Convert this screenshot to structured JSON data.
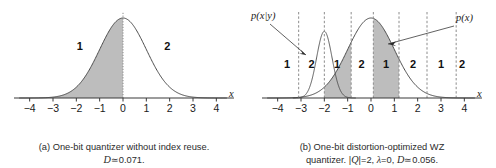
{
  "figure": {
    "background": "#ffffff",
    "curve_color": "#4a4a4a",
    "shade_color": "#bdbdbd",
    "axis_color": "#3a3a3a",
    "dash_color": "#8c8c8c"
  },
  "panel_a": {
    "caption_line1": "(a) One-bit quantizer without index reuse.",
    "caption_distortion_symbol": "D",
    "caption_line2_rest": "≃0.071.",
    "axis_label": "x",
    "ticks": [
      "−4",
      "−3",
      "−2",
      "−1",
      "0",
      "1",
      "2",
      "3",
      "4"
    ],
    "tick_values": [
      -4,
      -3,
      -2,
      -1,
      0,
      1,
      2,
      3,
      4
    ],
    "region_labels": [
      "1",
      "2"
    ],
    "boundaries": [
      0
    ],
    "shaded_intervals": [
      [
        -4.4,
        0
      ]
    ],
    "density": {
      "name": "p(x)",
      "type": "gaussian",
      "mean": 0,
      "sigma": 1.0
    }
  },
  "panel_b": {
    "caption_line1": "(b) One-bit distortion-optimized WZ",
    "caption_line2_prefix": "quantizer. |",
    "caption_q_symbol": "Q",
    "caption_line2_mid": "|=2, ",
    "caption_lambda_symbol": "λ",
    "caption_line2_mid2": "=0, ",
    "caption_distortion_symbol": "D",
    "caption_line2_rest": "≃0.056.",
    "axis_label": "x",
    "ticks": [
      "−4",
      "−3",
      "−2",
      "−1",
      "0",
      "1",
      "2",
      "3",
      "4"
    ],
    "tick_values": [
      -4,
      -3,
      -2,
      -1,
      0,
      1,
      2,
      3,
      4
    ],
    "region_labels": [
      "1",
      "2",
      "1",
      "2",
      "1",
      "2",
      "1",
      "2"
    ],
    "region_centers": [
      -3.6,
      -2.55,
      -1.45,
      -0.4,
      0.65,
      1.8,
      3.0,
      3.9
    ],
    "boundaries": [
      -3.1,
      -2.0,
      -0.85,
      0.1,
      1.2,
      2.4,
      3.65
    ],
    "shaded_intervals": [
      [
        -2.0,
        -0.85
      ],
      [
        0.1,
        1.2
      ]
    ],
    "annotation_pxy": "p(x|y)",
    "annotation_px": "p(x)",
    "densities": [
      {
        "name": "p(x)",
        "type": "gaussian",
        "mean": 0,
        "sigma": 1.0
      },
      {
        "name": "p(x|y)",
        "type": "gaussian",
        "mean": -2.0,
        "sigma": 0.33
      }
    ]
  },
  "chart_data": {
    "type": "line",
    "title": "",
    "xlabel": "x",
    "ylabel": "",
    "xlim": [
      -4.5,
      4.5
    ],
    "grid": false,
    "legend": "annotations",
    "panels": [
      {
        "id": "a",
        "caption": "(a) One-bit quantizer without index reuse. D≃0.071.",
        "distortion": 0.071,
        "xticks": [
          -4,
          -3,
          -2,
          -1,
          0,
          1,
          2,
          3,
          4
        ],
        "series": [
          {
            "name": "p(x)",
            "type": "gaussian",
            "mean": 0,
            "sigma": 1.0,
            "x": [
              -4,
              -3.5,
              -3,
              -2.5,
              -2,
              -1.5,
              -1,
              -0.5,
              0,
              0.5,
              1,
              1.5,
              2,
              2.5,
              3,
              3.5,
              4
            ],
            "values": [
              0.0001,
              0.0009,
              0.0044,
              0.0175,
              0.054,
              0.1295,
              0.242,
              0.3521,
              0.3989,
              0.3521,
              0.242,
              0.1295,
              0.054,
              0.0175,
              0.0044,
              0.0009,
              0.0001
            ]
          }
        ],
        "partition_boundaries": [
          0
        ],
        "region_labels": [
          "1",
          "2"
        ],
        "shaded_intervals": [
          [
            -4.4,
            0
          ]
        ]
      },
      {
        "id": "b",
        "caption": "(b) One-bit distortion-optimized WZ quantizer. |Q|=2, λ=0, D≃0.056.",
        "distortion": 0.056,
        "codebook_size": 2,
        "lambda": 0,
        "xticks": [
          -4,
          -3,
          -2,
          -1,
          0,
          1,
          2,
          3,
          4
        ],
        "series": [
          {
            "name": "p(x)",
            "type": "gaussian",
            "mean": 0,
            "sigma": 1.0,
            "x": [
              -4,
              -3.5,
              -3,
              -2.5,
              -2,
              -1.5,
              -1,
              -0.5,
              0,
              0.5,
              1,
              1.5,
              2,
              2.5,
              3,
              3.5,
              4
            ],
            "values": [
              0.0001,
              0.0009,
              0.0044,
              0.0175,
              0.054,
              0.1295,
              0.242,
              0.3521,
              0.3989,
              0.3521,
              0.242,
              0.1295,
              0.054,
              0.0175,
              0.0044,
              0.0009,
              0.0001
            ]
          },
          {
            "name": "p(x|y)",
            "type": "gaussian",
            "mean": -2.0,
            "sigma": 0.33,
            "x": [
              -3.2,
              -3,
              -2.8,
              -2.6,
              -2.4,
              -2.2,
              -2,
              -1.8,
              -1.6,
              -1.4,
              -1.2,
              -1,
              -0.8
            ],
            "values": [
              0.0015,
              0.0087,
              0.0383,
              0.1295,
              0.3358,
              0.6686,
              1.2089,
              0.6686,
              0.3358,
              0.1295,
              0.0383,
              0.0087,
              0.0015
            ]
          }
        ],
        "partition_boundaries": [
          -3.1,
          -2.0,
          -0.85,
          0.1,
          1.2,
          2.4,
          3.65
        ],
        "region_labels": [
          "1",
          "2",
          "1",
          "2",
          "1",
          "2",
          "1",
          "2"
        ],
        "shaded_intervals": [
          [
            -2.0,
            -0.85
          ],
          [
            0.1,
            1.2
          ]
        ]
      }
    ]
  }
}
